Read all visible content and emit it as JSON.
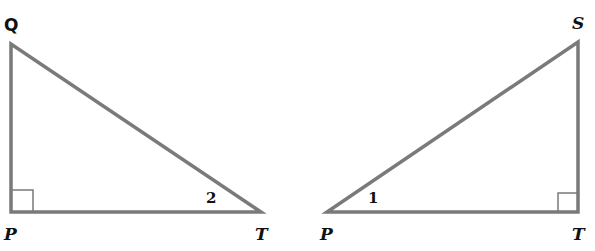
{
  "diagram": {
    "line_color": "#7a7a7a",
    "label_color": "#111111",
    "left_triangle": {
      "vertices": {
        "Q": {
          "label": "Q",
          "x": 11,
          "y": 44
        },
        "P": {
          "label": "P",
          "x": 11,
          "y": 212
        },
        "T": {
          "label": "T",
          "x": 261,
          "y": 212
        }
      },
      "right_angle_at": "P",
      "angle_marks": [
        {
          "label": "2",
          "at": "T"
        }
      ]
    },
    "right_triangle": {
      "vertices": {
        "P": {
          "label": "P",
          "x": 327,
          "y": 212
        },
        "T": {
          "label": "T",
          "x": 578,
          "y": 212
        },
        "S": {
          "label": "S",
          "x": 578,
          "y": 42
        }
      },
      "right_angle_at": "T",
      "angle_marks": [
        {
          "label": "1",
          "at": "P"
        }
      ]
    }
  }
}
